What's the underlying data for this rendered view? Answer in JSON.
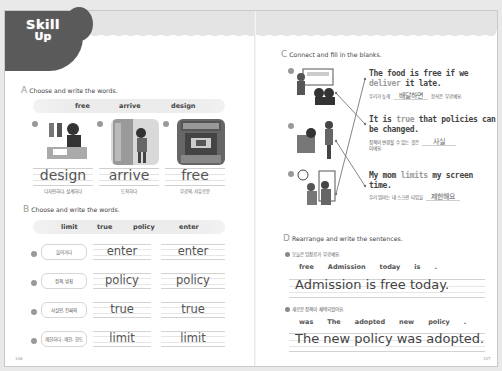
{
  "header": {
    "logo_line1": "Skill",
    "logo_line2": "Up"
  },
  "section_a": {
    "letter": "A",
    "title": "Choose and write the words.",
    "word_bank": [
      "free",
      "arrive",
      "design"
    ],
    "items": [
      {
        "num": "1",
        "answer": "design",
        "meaning": "디자인하다, 설계하다",
        "image": "fashion-designer-illustration"
      },
      {
        "num": "2",
        "answer": "arrive",
        "meaning": "도착하다",
        "image": "person-at-door-illustration"
      },
      {
        "num": "3",
        "answer": "free",
        "meaning": "무료의, 자유로운",
        "image": "ticket-booth-illustration"
      }
    ]
  },
  "section_b": {
    "letter": "B",
    "title": "Choose and write the words.",
    "word_bank": [
      "limit",
      "true",
      "policy",
      "enter"
    ],
    "items": [
      {
        "num": "1",
        "meaning": "들어가다",
        "answer1": "enter",
        "answer2": "enter"
      },
      {
        "num": "2",
        "meaning": "정책, 방침",
        "answer1": "policy",
        "answer2": "policy"
      },
      {
        "num": "3",
        "meaning": "사실인, 진짜의",
        "answer1": "true",
        "answer2": "true"
      },
      {
        "num": "4",
        "meaning": "제한하다, 제한, 한도",
        "answer1": "limit",
        "answer2": "limit"
      }
    ]
  },
  "section_c": {
    "letter": "C",
    "title": "Connect and fill in the blanks.",
    "images": [
      {
        "num": "1",
        "image": "teacher-presentation-illustration"
      },
      {
        "num": "2",
        "image": "family-discussion-illustration"
      },
      {
        "num": "3",
        "image": "clock-screen-time-illustration"
      }
    ],
    "sentences": [
      {
        "pre": "The food is free if we",
        "hl": "deliver",
        "post": "it late.",
        "ko_pre": "우리가 늦게",
        "blank": "배달하면",
        "ko_post": "음식은 무료예요."
      },
      {
        "pre": "It is",
        "hl": "true",
        "post": "that policies can be changed.",
        "ko_pre": "정책이 변경될 수 있는 것은",
        "blank": "사실",
        "ko_post": "이에요."
      },
      {
        "pre": "My mom",
        "hl": "limits",
        "post": "my screen time.",
        "ko_pre": "우리 엄마는 내 스크린 타임을",
        "blank": "제한해요",
        "ko_post": ""
      }
    ],
    "connections": [
      {
        "from_image": 1,
        "to_sentence": 2
      },
      {
        "from_image": 2,
        "to_sentence": 3
      },
      {
        "from_image": 3,
        "to_sentence": 1
      }
    ]
  },
  "section_d": {
    "letter": "D",
    "title": "Rearrange and write the sentences.",
    "items": [
      {
        "num": "1",
        "korean": "오늘은 입장료가 무료예요.",
        "words": [
          "free",
          "Admission",
          "today",
          "is",
          "."
        ],
        "answer": "Admission is free today."
      },
      {
        "num": "2",
        "korean": "새로운 정책이 채택되었어요.",
        "words": [
          "was",
          "The",
          "adopted",
          "new",
          "policy",
          "."
        ],
        "answer": "The new policy was adopted."
      }
    ]
  },
  "footer": {
    "left_page": "106",
    "right_page": "107"
  }
}
